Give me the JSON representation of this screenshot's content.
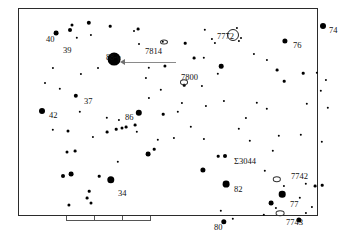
{
  "chart_data": {
    "type": "scatter",
    "title": "",
    "subtitle": "",
    "xlabel": "",
    "ylabel": "",
    "grid": false,
    "legend_position": "none",
    "axis_note": "star chart field, no numeric axes drawn",
    "xlim": [
      0,
      300
    ],
    "ylim": [
      0,
      208
    ],
    "symbol_legend": {
      "filled-disc": "star, size proportional to brightness",
      "open-circle": "open cluster",
      "small-ellipse": "galaxy"
    },
    "labels": [
      {
        "text": "40",
        "kind": "star-number",
        "x": 28,
        "y": 27
      },
      {
        "text": "39",
        "kind": "star-number",
        "x": 45,
        "y": 38
      },
      {
        "text": "88-γ",
        "kind": "star-named",
        "x": 88,
        "y": 46
      },
      {
        "text": "7814",
        "kind": "ngc",
        "x": 127,
        "y": 39
      },
      {
        "text": "7772",
        "kind": "ngc",
        "x": 199,
        "y": 24
      },
      {
        "text": "76",
        "kind": "star-number",
        "x": 275,
        "y": 33
      },
      {
        "text": "74",
        "kind": "star-number",
        "x": 311,
        "y": 18
      },
      {
        "text": "7800",
        "kind": "ngc",
        "x": 163,
        "y": 65
      },
      {
        "text": "37",
        "kind": "star-number",
        "x": 66,
        "y": 89
      },
      {
        "text": "42",
        "kind": "star-number",
        "x": 31,
        "y": 103
      },
      {
        "text": "86",
        "kind": "star-number",
        "x": 107,
        "y": 105
      },
      {
        "text": "Σ3044",
        "kind": "double-star",
        "x": 216,
        "y": 149
      },
      {
        "text": "7742",
        "kind": "ngc",
        "x": 273,
        "y": 164
      },
      {
        "text": "82",
        "kind": "star-number",
        "x": 216,
        "y": 177
      },
      {
        "text": "77",
        "kind": "star-number",
        "x": 272,
        "y": 192
      },
      {
        "text": "34",
        "kind": "star-number",
        "x": 100,
        "y": 181
      },
      {
        "text": "7743",
        "kind": "ngc",
        "x": 268,
        "y": 210
      },
      {
        "text": "80",
        "kind": "star-number",
        "x": 196,
        "y": 215
      }
    ],
    "stars": [
      {
        "x": 38,
        "y": 25,
        "r": 2.4
      },
      {
        "x": 52,
        "y": 22,
        "r": 2.0
      },
      {
        "x": 54,
        "y": 17,
        "r": 1.5
      },
      {
        "x": 59,
        "y": 30,
        "r": 1.2
      },
      {
        "x": 71,
        "y": 15,
        "r": 2.2
      },
      {
        "x": 73,
        "y": 27,
        "r": 1.1
      },
      {
        "x": 92,
        "y": 18,
        "r": 1.3
      },
      {
        "x": 120,
        "y": 21,
        "r": 1.4
      },
      {
        "x": 96,
        "y": 51,
        "r": 6.4
      },
      {
        "x": 121,
        "y": 36,
        "r": 1.0
      },
      {
        "x": 145,
        "y": 34,
        "r": 1.2
      },
      {
        "x": 147,
        "y": 58,
        "r": 1.6
      },
      {
        "x": 131,
        "y": 60,
        "r": 1.2
      },
      {
        "x": 116,
        "y": 23,
        "r": 1.0
      },
      {
        "x": 167,
        "y": 35,
        "r": 1.3
      },
      {
        "x": 176,
        "y": 50,
        "r": 1.4
      },
      {
        "x": 187,
        "y": 22,
        "r": 1.2
      },
      {
        "x": 194,
        "y": 31,
        "r": 1.1
      },
      {
        "x": 197,
        "y": 35,
        "r": 1.1
      },
      {
        "x": 219,
        "y": 20,
        "r": 1.1
      },
      {
        "x": 221,
        "y": 33,
        "r": 1.1
      },
      {
        "x": 223,
        "y": 30,
        "r": 1.0
      },
      {
        "x": 236,
        "y": 46,
        "r": 1.1
      },
      {
        "x": 267,
        "y": 33,
        "r": 2.6
      },
      {
        "x": 305,
        "y": 18,
        "r": 3.0
      },
      {
        "x": 186,
        "y": 50,
        "r": 1.2
      },
      {
        "x": 203,
        "y": 58,
        "r": 2.3
      },
      {
        "x": 200,
        "y": 66,
        "r": 1.2
      },
      {
        "x": 259,
        "y": 62,
        "r": 1.4
      },
      {
        "x": 266,
        "y": 73,
        "r": 1.3
      },
      {
        "x": 285,
        "y": 65,
        "r": 1.3
      },
      {
        "x": 299,
        "y": 65,
        "r": 1.2
      },
      {
        "x": 308,
        "y": 72,
        "r": 1.1
      },
      {
        "x": 303,
        "y": 83,
        "r": 1.2
      },
      {
        "x": 166,
        "y": 77,
        "r": 1.3
      },
      {
        "x": 143,
        "y": 82,
        "r": 1.2
      },
      {
        "x": 58,
        "y": 88,
        "r": 2.2
      },
      {
        "x": 42,
        "y": 81,
        "r": 1.2
      },
      {
        "x": 24,
        "y": 103,
        "r": 3.0
      },
      {
        "x": 121,
        "y": 105,
        "r": 3.2
      },
      {
        "x": 62,
        "y": 104,
        "r": 1.2
      },
      {
        "x": 89,
        "y": 110,
        "r": 1.2
      },
      {
        "x": 101,
        "y": 112,
        "r": 1.1
      },
      {
        "x": 145,
        "y": 106,
        "r": 1.3
      },
      {
        "x": 160,
        "y": 104,
        "r": 1.2
      },
      {
        "x": 188,
        "y": 98,
        "r": 1.1
      },
      {
        "x": 206,
        "y": 93,
        "r": 1.1
      },
      {
        "x": 239,
        "y": 95,
        "r": 1.2
      },
      {
        "x": 249,
        "y": 101,
        "r": 1.2
      },
      {
        "x": 289,
        "y": 96,
        "r": 1.2
      },
      {
        "x": 310,
        "y": 100,
        "r": 1.2
      },
      {
        "x": 35,
        "y": 122,
        "r": 1.2
      },
      {
        "x": 50,
        "y": 123,
        "r": 1.5
      },
      {
        "x": 89,
        "y": 124,
        "r": 1.4
      },
      {
        "x": 98,
        "y": 121,
        "r": 1.3
      },
      {
        "x": 104,
        "y": 120,
        "r": 1.5
      },
      {
        "x": 108,
        "y": 119,
        "r": 1.4
      },
      {
        "x": 117,
        "y": 117,
        "r": 1.4
      },
      {
        "x": 119,
        "y": 124,
        "r": 1.2
      },
      {
        "x": 75,
        "y": 129,
        "r": 1.1
      },
      {
        "x": 140,
        "y": 132,
        "r": 1.2
      },
      {
        "x": 156,
        "y": 130,
        "r": 1.1
      },
      {
        "x": 173,
        "y": 119,
        "r": 1.2
      },
      {
        "x": 221,
        "y": 121,
        "r": 1.2
      },
      {
        "x": 232,
        "y": 133,
        "r": 1.2
      },
      {
        "x": 261,
        "y": 128,
        "r": 1.2
      },
      {
        "x": 283,
        "y": 127,
        "r": 1.2
      },
      {
        "x": 304,
        "y": 134,
        "r": 1.2
      },
      {
        "x": 49,
        "y": 144,
        "r": 1.5
      },
      {
        "x": 57,
        "y": 143,
        "r": 1.4
      },
      {
        "x": 136,
        "y": 141,
        "r": 1.3
      },
      {
        "x": 130,
        "y": 146,
        "r": 2.4
      },
      {
        "x": 200,
        "y": 148,
        "r": 1.3
      },
      {
        "x": 207,
        "y": 148,
        "r": 2.0
      },
      {
        "x": 255,
        "y": 143,
        "r": 1.2
      },
      {
        "x": 185,
        "y": 162,
        "r": 2.6
      },
      {
        "x": 100,
        "y": 154,
        "r": 1.2
      },
      {
        "x": 93,
        "y": 172,
        "r": 3.7
      },
      {
        "x": 81,
        "y": 168,
        "r": 1.3
      },
      {
        "x": 53,
        "y": 166,
        "r": 2.4
      },
      {
        "x": 45,
        "y": 168,
        "r": 2.0
      },
      {
        "x": 208,
        "y": 176,
        "r": 3.4
      },
      {
        "x": 247,
        "y": 163,
        "r": 1.2
      },
      {
        "x": 266,
        "y": 178,
        "r": 1.1
      },
      {
        "x": 288,
        "y": 176,
        "r": 1.2
      },
      {
        "x": 297,
        "y": 178,
        "r": 1.4
      },
      {
        "x": 304,
        "y": 177,
        "r": 1.3
      },
      {
        "x": 264,
        "y": 186,
        "r": 3.3
      },
      {
        "x": 253,
        "y": 195,
        "r": 2.4
      },
      {
        "x": 258,
        "y": 200,
        "r": 1.1
      },
      {
        "x": 282,
        "y": 190,
        "r": 1.2
      },
      {
        "x": 246,
        "y": 207,
        "r": 1.2
      },
      {
        "x": 288,
        "y": 205,
        "r": 1.1
      },
      {
        "x": 294,
        "y": 199,
        "r": 1.1
      },
      {
        "x": 281,
        "y": 212,
        "r": 2.6
      },
      {
        "x": 206,
        "y": 214,
        "r": 2.7
      },
      {
        "x": 215,
        "y": 211,
        "r": 1.2
      },
      {
        "x": 203,
        "y": 203,
        "r": 1.2
      },
      {
        "x": 71,
        "y": 183,
        "r": 1.3
      },
      {
        "x": 69,
        "y": 190,
        "r": 1.4
      },
      {
        "x": 73,
        "y": 195,
        "r": 1.5
      },
      {
        "x": 51,
        "y": 197,
        "r": 1.6
      },
      {
        "x": 186,
        "y": 131,
        "r": 1.1
      },
      {
        "x": 228,
        "y": 110,
        "r": 1.1
      },
      {
        "x": 164,
        "y": 95,
        "r": 1.1
      },
      {
        "x": 131,
        "y": 90,
        "r": 1.1
      },
      {
        "x": 80,
        "y": 60,
        "r": 1.0
      },
      {
        "x": 63,
        "y": 66,
        "r": 1.1
      },
      {
        "x": 35,
        "y": 60,
        "r": 1.1
      },
      {
        "x": 27,
        "y": 75,
        "r": 1.0
      },
      {
        "x": 128,
        "y": 70,
        "r": 1.1
      },
      {
        "x": 184,
        "y": 78,
        "r": 1.1
      },
      {
        "x": 249,
        "y": 52,
        "r": 1.1
      }
    ],
    "deep_sky_objects": [
      {
        "id": "7772",
        "type": "open-cluster",
        "x": 215,
        "y": 27,
        "rx": 5.0,
        "ry": 5.0
      },
      {
        "id": "7814",
        "type": "galaxy",
        "x": 146,
        "y": 34,
        "rx": 3.0,
        "ry": 1.6
      },
      {
        "id": "7800",
        "type": "galaxy",
        "x": 166,
        "y": 74,
        "rx": 3.0,
        "ry": 1.8
      },
      {
        "id": "7742",
        "type": "galaxy",
        "x": 259,
        "y": 171,
        "rx": 3.2,
        "ry": 1.8
      },
      {
        "id": "7743",
        "type": "galaxy",
        "x": 262,
        "y": 205,
        "rx": 3.4,
        "ry": 1.8
      }
    ],
    "annotation_arrow": {
      "label": "88-γ",
      "from_x": 158,
      "from_y": 54,
      "to_x": 107,
      "to_y": 54,
      "points_to": "88-γ"
    },
    "scale_bar": {
      "x": 48,
      "y": 206,
      "width": 84,
      "ticks": [
        0,
        0.333,
        0.666,
        1.0
      ],
      "label": ""
    }
  }
}
